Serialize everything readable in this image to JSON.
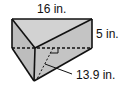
{
  "diagram": {
    "type": "triangular-prism",
    "labels": {
      "length": "16 in.",
      "height": "5 in.",
      "triangle_height": "13.9 in."
    },
    "colors": {
      "face_fill": "#c8c8c8",
      "stroke": "#111111"
    }
  }
}
